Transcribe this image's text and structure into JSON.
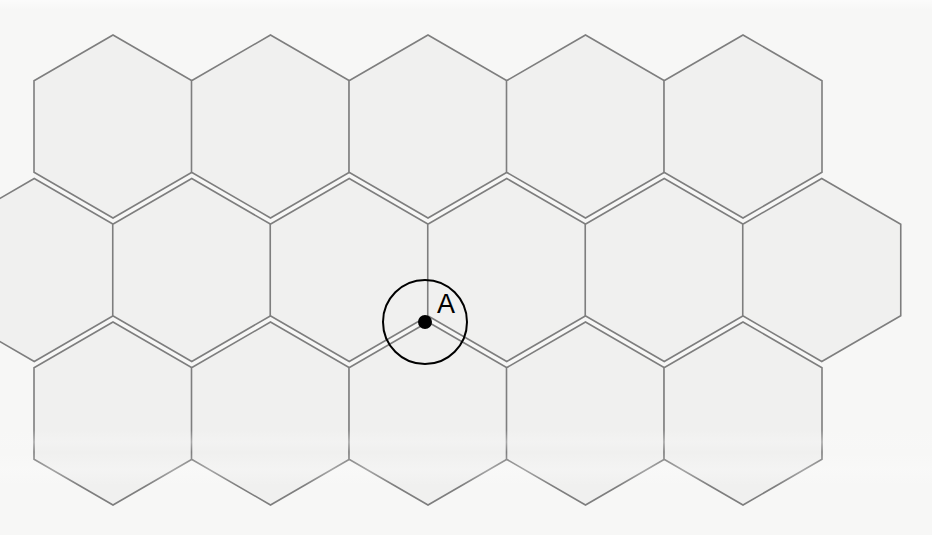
{
  "figure": {
    "canvas": {
      "width": 932,
      "height": 535
    },
    "background_color": "#f7f7f6",
    "hexagon": {
      "fill_color": "#f0f0ef",
      "stroke_color": "#7e7e7e",
      "stroke_width": 1.6,
      "orientation": "pointy-top",
      "width": 158,
      "apex_to_apex_height": 183,
      "side_length": 91.5,
      "column_spacing": 157.5,
      "row_spacing": 143.5,
      "row_x_offset": 78.75
    },
    "columns_top_row_x": [
      113,
      270,
      428,
      585,
      743
    ],
    "row_apex_y": [
      35,
      178.5,
      322
    ],
    "tiling_note": "Three staggered rows of pointy-top hexagons filling the frame"
  },
  "annotation": {
    "point": {
      "name": "A",
      "label": "A",
      "x": 425,
      "y": 322,
      "dot_radius": 7,
      "dot_color": "#000000",
      "label_x": 437,
      "label_y": 313
    },
    "circle": {
      "center_x": 425,
      "center_y": 322,
      "radius": 42,
      "stroke_color": "#000000",
      "stroke_width": 2,
      "fill": "none"
    },
    "description": "A black circle of radius 42 px centered on vertex A, where three hexagons meet"
  },
  "hex_cells": [
    {
      "row": 0,
      "col": 0,
      "cx": 113,
      "cy": 126.5
    },
    {
      "row": 0,
      "col": 1,
      "cx": 270.5,
      "cy": 126.5
    },
    {
      "row": 0,
      "col": 2,
      "cx": 428,
      "cy": 126.5
    },
    {
      "row": 0,
      "col": 3,
      "cx": 585.5,
      "cy": 126.5
    },
    {
      "row": 0,
      "col": 4,
      "cx": 743,
      "cy": 126.5
    },
    {
      "row": 1,
      "col": -1,
      "cx": 34.25,
      "cy": 270
    },
    {
      "row": 1,
      "col": 0,
      "cx": 191.75,
      "cy": 270
    },
    {
      "row": 1,
      "col": 1,
      "cx": 349.25,
      "cy": 270
    },
    {
      "row": 1,
      "col": 2,
      "cx": 506.75,
      "cy": 270
    },
    {
      "row": 1,
      "col": 3,
      "cx": 664.25,
      "cy": 270
    },
    {
      "row": 1,
      "col": 4,
      "cx": 821.75,
      "cy": 270
    },
    {
      "row": 2,
      "col": 0,
      "cx": 113,
      "cy": 413.5
    },
    {
      "row": 2,
      "col": 1,
      "cx": 270.5,
      "cy": 413.5
    },
    {
      "row": 2,
      "col": 2,
      "cx": 428,
      "cy": 413.5
    },
    {
      "row": 2,
      "col": 3,
      "cx": 585.5,
      "cy": 413.5
    },
    {
      "row": 2,
      "col": 4,
      "cx": 743,
      "cy": 413.5
    }
  ]
}
